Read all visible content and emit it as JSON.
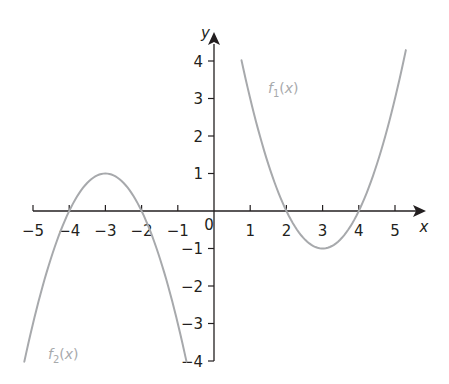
{
  "chart_data": {
    "type": "line",
    "title": "",
    "xlabel": "x",
    "ylabel": "y",
    "xlim": [
      -5,
      5
    ],
    "ylim": [
      -4,
      4
    ],
    "grid": false,
    "origin_label": "0",
    "x_ticks": [
      -5,
      -4,
      -3,
      -2,
      -1,
      1,
      2,
      3,
      4,
      5
    ],
    "x_tick_labels": [
      "−5",
      "−4",
      "−3",
      "−2",
      "−1",
      "1",
      "2",
      "3",
      "4",
      "5"
    ],
    "y_ticks": [
      4,
      3,
      2,
      1,
      -1,
      -2,
      -3,
      -4
    ],
    "y_tick_labels": [
      "4",
      "3",
      "2",
      "1",
      "−1",
      "−2",
      "−3",
      "−4"
    ],
    "series": [
      {
        "name": "f1(x)",
        "label_main": "f",
        "label_sub": "1",
        "label_arg": "(x)",
        "expression": "(x-3)^2 - 1",
        "domain": [
          0.76,
          5.3
        ],
        "color": "#a7a9ac",
        "x": [
          0.76,
          1,
          1.5,
          2,
          2.5,
          3,
          3.5,
          4,
          4.5,
          5,
          5.3
        ],
        "y": [
          4.02,
          3,
          1.25,
          0,
          -0.75,
          -1,
          -0.75,
          0,
          1.25,
          3,
          4.29
        ]
      },
      {
        "name": "f2(x)",
        "label_main": "f",
        "label_sub": "2",
        "label_arg": "(x)",
        "expression": "-(x+3)^2 + 1",
        "domain": [
          -5.24,
          -0.76
        ],
        "color": "#a7a9ac",
        "x": [
          -5.24,
          -5,
          -4.5,
          -4,
          -3.5,
          -3,
          -2.5,
          -2,
          -1.5,
          -1,
          -0.76
        ],
        "y": [
          -4.02,
          -3,
          -1.25,
          0,
          0.75,
          1,
          0.75,
          0,
          -1.25,
          -3,
          -4.02
        ]
      }
    ],
    "key_points": {
      "f1_roots": [
        2,
        4
      ],
      "f1_vertex": [
        3,
        -1
      ],
      "f2_roots": [
        -4,
        -2
      ],
      "f2_vertex": [
        -3,
        1
      ]
    }
  },
  "layout": {
    "origin_px": [
      214,
      211
    ],
    "x_unit_px": 36.2,
    "y_unit_px": 37.5
  },
  "colors": {
    "axis": "#231f20",
    "curve": "#a7a9ac"
  }
}
